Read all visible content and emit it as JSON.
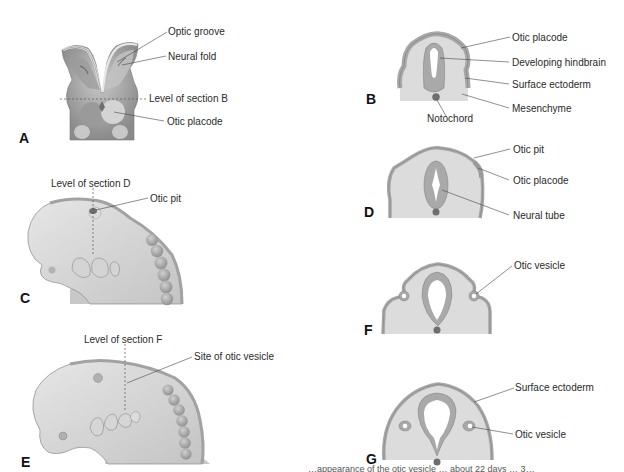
{
  "figure": {
    "panels": {
      "A": {
        "letter": "A",
        "labels": [
          "Optic groove",
          "Neural fold",
          "Level of section B",
          "Otic placode"
        ]
      },
      "B": {
        "letter": "B",
        "labels": [
          "Otic placode",
          "Developing hindbrain",
          "Surface ectoderm",
          "Mesenchyme",
          "Notochord"
        ]
      },
      "C": {
        "letter": "C",
        "labels": [
          "Level of section D",
          "Otic pit"
        ]
      },
      "D": {
        "letter": "D",
        "labels": [
          "Otic pit",
          "Otic placode",
          "Neural tube"
        ]
      },
      "E": {
        "letter": "E",
        "labels": [
          "Level of section F",
          "Site of otic vesicle"
        ]
      },
      "F": {
        "letter": "F",
        "labels": [
          "Otic vesicle"
        ]
      },
      "G": {
        "letter": "G",
        "labels": [
          "Surface ectoderm",
          "Otic vesicle"
        ]
      }
    },
    "caption_partial": "…appearance of the otic vesicle … about 22 days … 3…"
  },
  "colors": {
    "tissue_light": "#dcdcdc",
    "tissue_mid": "#b9b9b9",
    "tissue_dark": "#8e8e8e",
    "neural": "#a9a9a9",
    "outline": "#7a7a7a",
    "leader_line": "#444444",
    "text": "#2a2a2a"
  }
}
